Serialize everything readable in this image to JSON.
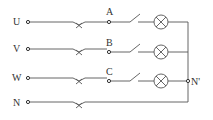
{
  "diagram": {
    "type": "three-phase four-wire lamp circuit",
    "lines": [
      {
        "label": "U",
        "node": "A",
        "y": 22,
        "has_lamp": true
      },
      {
        "label": "V",
        "node": "B",
        "y": 47,
        "has_lamp": true
      },
      {
        "label": "W",
        "node": "C",
        "y": 81,
        "has_lamp": true
      },
      {
        "label": "N",
        "node": "",
        "y": 102,
        "has_lamp": false
      }
    ],
    "neutral_point_label": "N'",
    "colors": {
      "wire": "#555555",
      "text": "#333333",
      "background": "#ffffff"
    }
  }
}
